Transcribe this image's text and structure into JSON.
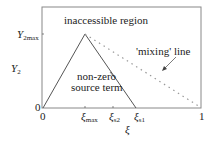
{
  "diagram": {
    "regions": {
      "inaccessible": "inaccessible region",
      "source_line1": "non-zero",
      "source_line2": "source term"
    },
    "annotation": "'mixing' line",
    "y_axis": {
      "label": "Y",
      "label_sub": "2",
      "ticks": [
        {
          "main": "Y",
          "sub": "2max"
        },
        {
          "main": "0",
          "sub": ""
        }
      ]
    },
    "x_axis": {
      "label": "ξ",
      "ticks": [
        {
          "main": "0",
          "sub": ""
        },
        {
          "main": "ξ",
          "sub": "max"
        },
        {
          "main": "ξ",
          "sub": "s2"
        },
        {
          "main": "ξ",
          "sub": "s1"
        },
        {
          "main": "1",
          "sub": ""
        }
      ]
    },
    "colors": {
      "frame": "#888888",
      "triangle": "#555555",
      "mixing": "#999999"
    }
  }
}
